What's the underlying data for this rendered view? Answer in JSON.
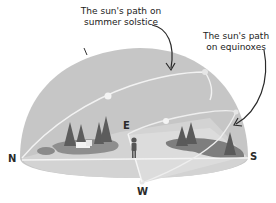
{
  "diagram": {
    "type": "sky-dome sun path illustration",
    "annotations": [
      {
        "id": "summer",
        "line1": "The sun's path on",
        "line2": "summer solstice"
      },
      {
        "id": "equinox",
        "line1": "The sun's path",
        "line2": "on equinoxes"
      }
    ],
    "directions": {
      "north": "N",
      "east": "E",
      "south": "S",
      "west": "W"
    },
    "colors": {
      "dome": "#c4c4c4",
      "ground": "#dadada",
      "paths": "#f4f4f4",
      "trees": "#5e5e5e",
      "text": "#222222",
      "arrows": "#2a2a2a"
    }
  }
}
